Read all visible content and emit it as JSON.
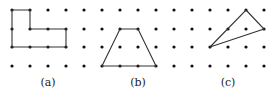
{
  "figure": {
    "grid": {
      "xs": [
        12,
        30,
        48,
        66,
        84,
        102,
        120,
        138,
        156,
        174,
        192,
        210,
        228,
        246,
        264
      ],
      "ys": [
        10,
        29,
        47,
        66
      ],
      "dot_color": "#111111"
    },
    "panels": [
      {
        "id": "a",
        "label": "(a)",
        "label_x": 48,
        "shape": "L-shaped polygon",
        "points": [
          [
            12,
            10
          ],
          [
            30,
            10
          ],
          [
            30,
            29
          ],
          [
            66,
            29
          ],
          [
            66,
            47
          ],
          [
            12,
            47
          ]
        ]
      },
      {
        "id": "b",
        "label": "(b)",
        "label_x": 138,
        "shape": "trapezoid",
        "points": [
          [
            120,
            29
          ],
          [
            138,
            29
          ],
          [
            156,
            66
          ],
          [
            102,
            66
          ]
        ]
      },
      {
        "id": "c",
        "label": "(c)",
        "label_x": 228,
        "shape": "triangle",
        "points": [
          [
            246,
            10
          ],
          [
            264,
            29
          ],
          [
            210,
            47
          ]
        ]
      }
    ]
  }
}
